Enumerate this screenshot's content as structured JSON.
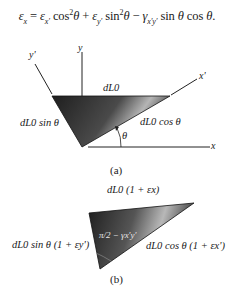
{
  "equation": {
    "text": "εx = εx' cos²θ + εy' sin²θ − γx'y' sin θ cos θ."
  },
  "figure_a": {
    "caption": "(a)",
    "axes": {
      "x": "x",
      "y": "y",
      "x_prime": "x'",
      "y_prime": "y'"
    },
    "labels": {
      "top": "dL0",
      "left": "dL0 sin θ",
      "right": "dL0 cos θ",
      "angle": "θ"
    }
  },
  "figure_b": {
    "caption": "(b)",
    "labels": {
      "top": "dL0 (1 + εx)",
      "left": "dL0 sin θ (1 + εy')",
      "right": "dL0 cos θ (1 + εx')",
      "angle": "π/2 − γx'y'"
    }
  },
  "colors": {
    "triangle_dark": "#2a2a2a",
    "triangle_light": "#bdbdbd",
    "line": "#222222"
  }
}
